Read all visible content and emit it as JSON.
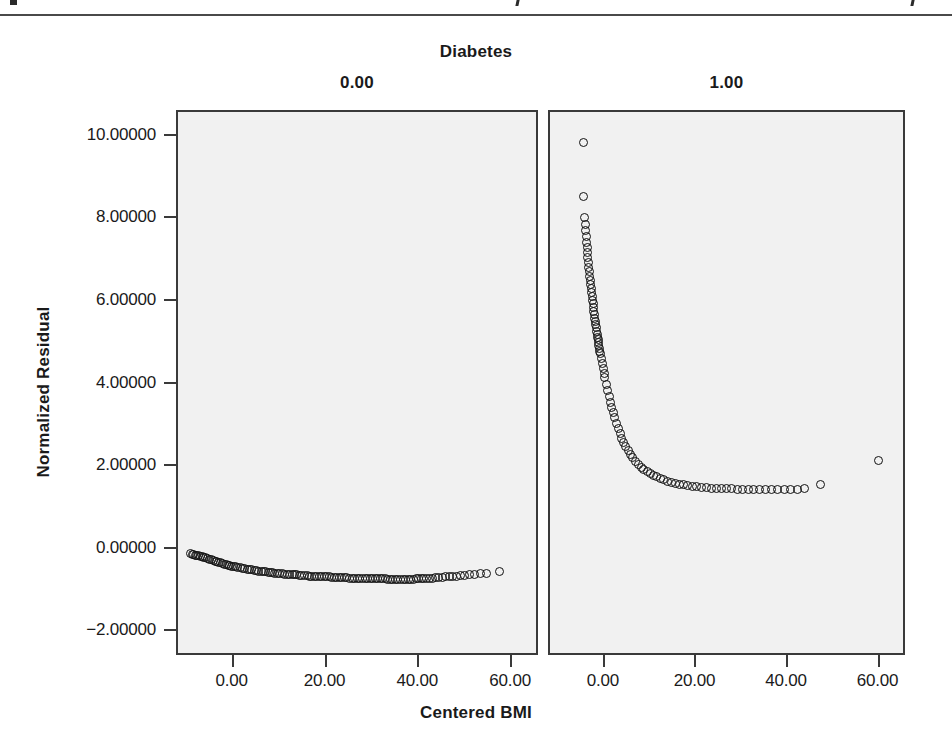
{
  "figure": {
    "strip_title": "Diabetes",
    "panels": [
      {
        "key": "p0",
        "header": "0.00"
      },
      {
        "key": "p1",
        "header": "1.00"
      }
    ],
    "y_axis_title": "Normalized Residual",
    "x_axis_title": "Centered BMI",
    "background_color": "#f1f1f1",
    "frame_color": "#3a3a3a",
    "marker_color": "#111111"
  },
  "chart_data": {
    "type": "scatter",
    "title": "Diabetes",
    "xlabel": "Centered BMI",
    "ylabel": "Normalized Residual",
    "grid": false,
    "legend": "none",
    "facet_variable": "Diabetes",
    "facet_levels": [
      "0.00",
      "1.00"
    ],
    "xlim": [
      -12.0,
      66.0
    ],
    "ylim": [
      -2.6,
      10.6
    ],
    "xticks": [
      0.0,
      20.0,
      40.0,
      60.0
    ],
    "xticklabels": [
      "0.00",
      "20.00",
      "40.00",
      "60.00"
    ],
    "yticks": [
      -2.0,
      0.0,
      2.0,
      4.0,
      6.0,
      8.0,
      10.0
    ],
    "yticklabels": [
      "-2.00000",
      "0.00000",
      "2.00000",
      "4.00000",
      "6.00000",
      "8.00000",
      "10.00000"
    ],
    "marker": "open-circle",
    "series": [
      {
        "name": "Diabetes = 0.00",
        "panel": "p0",
        "description": "Dense band of normalized residuals forming a shallow downward U-shape, from about -0.10 at Centered BMI -9 down to about -0.72 near BMI 40, then rising slightly toward -0.52 at BMI 57.",
        "n_points": 118,
        "points": [
          [
            -9.2,
            -0.1
          ],
          [
            -8.9,
            -0.11
          ],
          [
            -8.6,
            -0.12
          ],
          [
            -8.3,
            -0.13
          ],
          [
            -8.0,
            -0.14
          ],
          [
            -7.6,
            -0.15
          ],
          [
            -7.2,
            -0.16
          ],
          [
            -6.8,
            -0.17
          ],
          [
            -6.4,
            -0.19
          ],
          [
            -6.0,
            -0.2
          ],
          [
            -5.6,
            -0.22
          ],
          [
            -5.2,
            -0.23
          ],
          [
            -4.8,
            -0.25
          ],
          [
            -4.4,
            -0.26
          ],
          [
            -4.0,
            -0.28
          ],
          [
            -3.6,
            -0.29
          ],
          [
            -3.2,
            -0.31
          ],
          [
            -2.8,
            -0.32
          ],
          [
            -2.4,
            -0.34
          ],
          [
            -2.0,
            -0.35
          ],
          [
            -1.6,
            -0.36
          ],
          [
            -1.2,
            -0.38
          ],
          [
            -0.8,
            -0.39
          ],
          [
            -0.4,
            -0.4
          ],
          [
            0.0,
            -0.41
          ],
          [
            0.4,
            -0.42
          ],
          [
            0.9,
            -0.43
          ],
          [
            1.4,
            -0.44
          ],
          [
            1.9,
            -0.45
          ],
          [
            2.4,
            -0.46
          ],
          [
            2.9,
            -0.47
          ],
          [
            3.4,
            -0.48
          ],
          [
            3.9,
            -0.49
          ],
          [
            4.4,
            -0.5
          ],
          [
            4.9,
            -0.51
          ],
          [
            5.4,
            -0.52
          ],
          [
            5.9,
            -0.53
          ],
          [
            6.4,
            -0.53
          ],
          [
            6.9,
            -0.54
          ],
          [
            7.4,
            -0.55
          ],
          [
            7.9,
            -0.55
          ],
          [
            8.4,
            -0.56
          ],
          [
            8.9,
            -0.57
          ],
          [
            9.4,
            -0.57
          ],
          [
            9.9,
            -0.58
          ],
          [
            10.5,
            -0.58
          ],
          [
            11.0,
            -0.59
          ],
          [
            11.5,
            -0.59
          ],
          [
            12.0,
            -0.6
          ],
          [
            12.6,
            -0.6
          ],
          [
            13.1,
            -0.61
          ],
          [
            13.6,
            -0.61
          ],
          [
            14.2,
            -0.62
          ],
          [
            14.7,
            -0.62
          ],
          [
            15.2,
            -0.63
          ],
          [
            15.8,
            -0.63
          ],
          [
            16.3,
            -0.64
          ],
          [
            16.8,
            -0.64
          ],
          [
            17.4,
            -0.64
          ],
          [
            17.9,
            -0.65
          ],
          [
            18.4,
            -0.65
          ],
          [
            19.0,
            -0.65
          ],
          [
            19.5,
            -0.66
          ],
          [
            20.0,
            -0.66
          ],
          [
            20.6,
            -0.66
          ],
          [
            21.1,
            -0.67
          ],
          [
            21.7,
            -0.67
          ],
          [
            22.2,
            -0.67
          ],
          [
            22.8,
            -0.68
          ],
          [
            23.3,
            -0.68
          ],
          [
            23.9,
            -0.68
          ],
          [
            24.4,
            -0.68
          ],
          [
            25.0,
            -0.69
          ],
          [
            25.5,
            -0.69
          ],
          [
            26.1,
            -0.69
          ],
          [
            26.6,
            -0.69
          ],
          [
            27.2,
            -0.7
          ],
          [
            27.7,
            -0.7
          ],
          [
            28.3,
            -0.7
          ],
          [
            28.8,
            -0.7
          ],
          [
            29.4,
            -0.7
          ],
          [
            29.9,
            -0.71
          ],
          [
            30.5,
            -0.71
          ],
          [
            31.0,
            -0.71
          ],
          [
            31.6,
            -0.71
          ],
          [
            32.1,
            -0.71
          ],
          [
            32.7,
            -0.71
          ],
          [
            33.2,
            -0.72
          ],
          [
            33.8,
            -0.72
          ],
          [
            34.3,
            -0.72
          ],
          [
            34.9,
            -0.72
          ],
          [
            35.4,
            -0.72
          ],
          [
            36.0,
            -0.72
          ],
          [
            36.5,
            -0.72
          ],
          [
            37.1,
            -0.72
          ],
          [
            37.6,
            -0.72
          ],
          [
            38.2,
            -0.72
          ],
          [
            38.7,
            -0.72
          ],
          [
            39.3,
            -0.71
          ],
          [
            39.8,
            -0.71
          ],
          [
            40.4,
            -0.71
          ],
          [
            41.0,
            -0.7
          ],
          [
            41.6,
            -0.7
          ],
          [
            42.2,
            -0.69
          ],
          [
            42.9,
            -0.69
          ],
          [
            43.5,
            -0.68
          ],
          [
            44.2,
            -0.68
          ],
          [
            44.9,
            -0.67
          ],
          [
            45.6,
            -0.66
          ],
          [
            46.4,
            -0.66
          ],
          [
            47.2,
            -0.65
          ],
          [
            48.0,
            -0.64
          ],
          [
            48.9,
            -0.63
          ],
          [
            49.8,
            -0.62
          ],
          [
            50.8,
            -0.61
          ],
          [
            51.9,
            -0.6
          ],
          [
            53.1,
            -0.58
          ],
          [
            54.5,
            -0.57
          ],
          [
            57.3,
            -0.52
          ]
        ]
      },
      {
        "name": "Diabetes = 1.00",
        "panel": "p1",
        "description": "Sharply decaying curve of normalized residuals: starts near 9.87 at Centered BMI -5, drops steeply through 8.55, 8.0, 6.0 and 4.0, flattening to about 1.45 beyond BMI 25; isolated points at BMI 47 (1.58) and BMI 60 (2.17).",
        "n_points": 96,
        "points": [
          [
            -4.7,
            9.87
          ],
          [
            -4.6,
            8.55
          ],
          [
            -4.4,
            8.05
          ],
          [
            -4.3,
            7.88
          ],
          [
            -4.2,
            7.72
          ],
          [
            -4.1,
            7.58
          ],
          [
            -4.0,
            7.44
          ],
          [
            -3.9,
            7.31
          ],
          [
            -3.8,
            7.19
          ],
          [
            -3.7,
            7.07
          ],
          [
            -3.6,
            6.95
          ],
          [
            -3.5,
            6.84
          ],
          [
            -3.4,
            6.73
          ],
          [
            -3.3,
            6.62
          ],
          [
            -3.2,
            6.52
          ],
          [
            -3.1,
            6.42
          ],
          [
            -3.0,
            6.32
          ],
          [
            -2.9,
            6.22
          ],
          [
            -2.8,
            6.13
          ],
          [
            -2.7,
            6.04
          ],
          [
            -2.6,
            5.95
          ],
          [
            -2.5,
            5.86
          ],
          [
            -2.4,
            5.77
          ],
          [
            -2.3,
            5.69
          ],
          [
            -2.2,
            5.61
          ],
          [
            -2.1,
            5.53
          ],
          [
            -2.0,
            5.45
          ],
          [
            -1.9,
            5.37
          ],
          [
            -1.8,
            5.29
          ],
          [
            -1.7,
            5.22
          ],
          [
            -1.6,
            5.15
          ],
          [
            -1.5,
            5.08
          ],
          [
            -1.4,
            5.01
          ],
          [
            -1.3,
            4.94
          ],
          [
            -1.2,
            4.87
          ],
          [
            -1.1,
            4.8
          ],
          [
            -1.0,
            4.74
          ],
          [
            -0.8,
            4.62
          ],
          [
            -0.6,
            4.5
          ],
          [
            -0.4,
            4.38
          ],
          [
            -0.2,
            4.27
          ],
          [
            0.0,
            4.16
          ],
          [
            0.3,
            4.0
          ],
          [
            0.6,
            3.85
          ],
          [
            0.9,
            3.71
          ],
          [
            1.2,
            3.57
          ],
          [
            1.5,
            3.44
          ],
          [
            1.8,
            3.32
          ],
          [
            2.1,
            3.2
          ],
          [
            2.5,
            3.06
          ],
          [
            2.9,
            2.93
          ],
          [
            3.3,
            2.81
          ],
          [
            3.7,
            2.7
          ],
          [
            4.1,
            2.6
          ],
          [
            4.6,
            2.49
          ],
          [
            5.1,
            2.39
          ],
          [
            5.6,
            2.3
          ],
          [
            6.1,
            2.22
          ],
          [
            6.7,
            2.14
          ],
          [
            7.3,
            2.07
          ],
          [
            7.9,
            2.0
          ],
          [
            8.5,
            1.95
          ],
          [
            9.2,
            1.89
          ],
          [
            9.9,
            1.84
          ],
          [
            10.6,
            1.8
          ],
          [
            11.3,
            1.76
          ],
          [
            12.1,
            1.72
          ],
          [
            12.9,
            1.69
          ],
          [
            13.7,
            1.66
          ],
          [
            14.5,
            1.63
          ],
          [
            15.4,
            1.61
          ],
          [
            16.3,
            1.59
          ],
          [
            17.2,
            1.57
          ],
          [
            18.1,
            1.55
          ],
          [
            19.1,
            1.54
          ],
          [
            20.1,
            1.52
          ],
          [
            21.1,
            1.51
          ],
          [
            22.1,
            1.5
          ],
          [
            23.2,
            1.49
          ],
          [
            24.3,
            1.48
          ],
          [
            25.4,
            1.48
          ],
          [
            26.5,
            1.47
          ],
          [
            27.7,
            1.47
          ],
          [
            28.9,
            1.46
          ],
          [
            30.1,
            1.46
          ],
          [
            31.3,
            1.46
          ],
          [
            32.5,
            1.45
          ],
          [
            33.8,
            1.45
          ],
          [
            35.1,
            1.45
          ],
          [
            36.4,
            1.45
          ],
          [
            37.8,
            1.45
          ],
          [
            39.2,
            1.45
          ],
          [
            40.6,
            1.46
          ],
          [
            42.1,
            1.46
          ],
          [
            43.6,
            1.47
          ],
          [
            47.2,
            1.58
          ],
          [
            59.8,
            2.17
          ]
        ]
      }
    ]
  }
}
